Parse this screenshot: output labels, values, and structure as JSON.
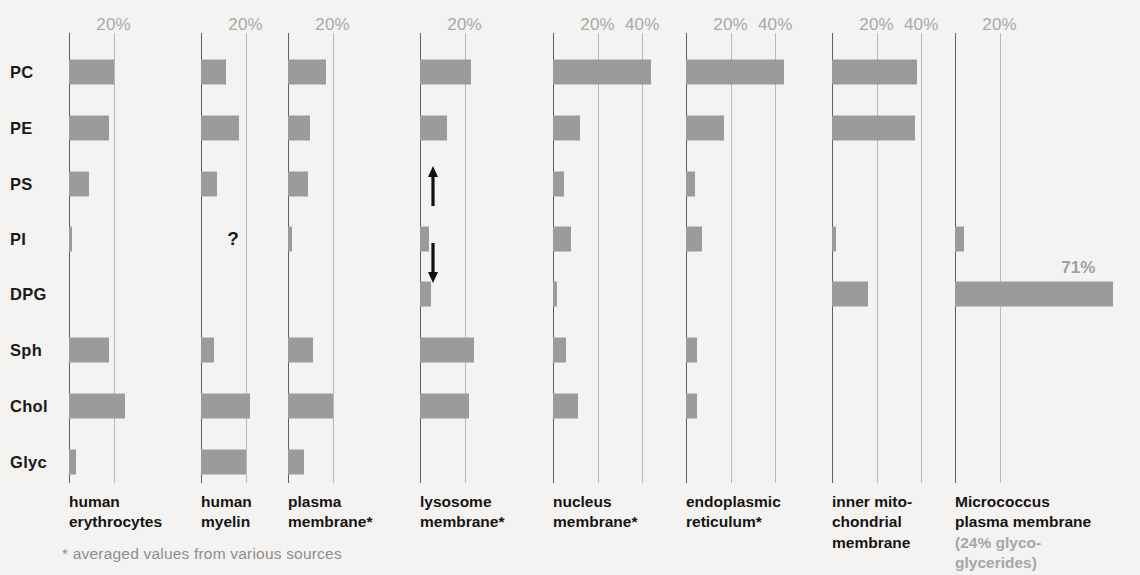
{
  "chart_data": {
    "type": "bar",
    "orientation": "horizontal",
    "xlabel": "",
    "ylabel": "",
    "unit": "%",
    "grid": true,
    "legend_position": "none",
    "categories": [
      "PC",
      "PE",
      "PS",
      "PI",
      "DPG",
      "Sph",
      "Chol",
      "Glyc"
    ],
    "category_full_names": [
      "Phosphatidylcholine",
      "Phosphatidylethanolamine",
      "Phosphatidylserine",
      "Phosphatidylinositol",
      "Diphosphatidylglycerol (cardiolipin)",
      "Sphingomyelin",
      "Cholesterol",
      "Glycolipids"
    ],
    "series": [
      {
        "name": "human erythrocytes",
        "caption": "human\nerythrocytes",
        "ticks": [
          20
        ],
        "xmax": 26,
        "values": [
          20,
          18,
          9,
          1,
          0,
          18,
          25,
          3
        ]
      },
      {
        "name": "human myelin",
        "caption": "human\nmyelin",
        "ticks": [
          20
        ],
        "xmax": 26,
        "values": [
          11,
          17,
          7,
          null,
          0,
          6,
          22,
          20
        ],
        "unknown_marker": {
          "category": "PI",
          "symbol": "?"
        }
      },
      {
        "name": "plasma membrane*",
        "caption": "plasma\nmembrane*",
        "ticks": [
          20
        ],
        "xmax": 26,
        "values": [
          17,
          10,
          9,
          2,
          0,
          11,
          20,
          7
        ]
      },
      {
        "name": "lysosome membrane*",
        "caption": "lysosome\nmembrane*",
        "ticks": [
          20
        ],
        "xmax": 26,
        "values": [
          23,
          12,
          0,
          4,
          5,
          24,
          22,
          0
        ],
        "variability_arrows": {
          "between": [
            "PS",
            "DPG"
          ],
          "note": "variable range"
        }
      },
      {
        "name": "nucleus membrane*",
        "caption": "nucleus\nmembrane*",
        "ticks": [
          20,
          40
        ],
        "xmax": 48,
        "values": [
          44,
          12,
          5,
          8,
          2,
          6,
          11,
          0
        ]
      },
      {
        "name": "endoplasmic reticulum*",
        "caption": "endoplasmic\nreticulum*",
        "ticks": [
          20,
          40
        ],
        "xmax": 48,
        "values": [
          44,
          17,
          4,
          7,
          0,
          5,
          5,
          0
        ]
      },
      {
        "name": "inner mitochondrial membrane",
        "caption": "inner mito-\nchondrial\nmembrane",
        "ticks": [
          20,
          40
        ],
        "xmax": 48,
        "values": [
          38,
          37,
          0,
          2,
          16,
          0,
          0,
          0
        ]
      },
      {
        "name": "Micrococcus plasma membrane",
        "caption": "Micrococcus\nplasma membrane",
        "subcaption": "(24% glyco-\nglycerides)",
        "ticks": [
          20
        ],
        "xmax": 80,
        "values": [
          0,
          0,
          0,
          4,
          71,
          0,
          0,
          0
        ],
        "data_labels": {
          "DPG": "71%"
        }
      }
    ],
    "footnote": "* averaged values from various sources"
  },
  "colors": {
    "bar": "#9b9b9b",
    "baseline": "#5e5e5e",
    "gridline": "#b9b9b9",
    "tick_text": "#a9a9a9",
    "label_text": "#1a1a1a",
    "muted_text": "#a6a6a6",
    "background": "#f4f3f1"
  }
}
